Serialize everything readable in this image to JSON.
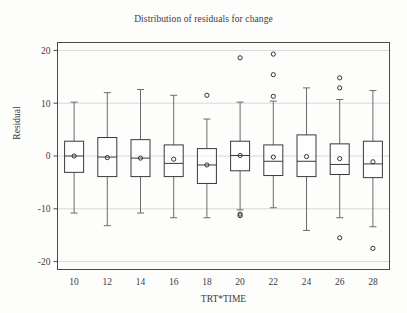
{
  "chart_data": {
    "type": "box",
    "title": "Distribution of residuals for change",
    "xlabel": "TRT*TIME",
    "ylabel": "Residual",
    "categories": [
      "10",
      "12",
      "14",
      "16",
      "18",
      "20",
      "22",
      "24",
      "26",
      "28"
    ],
    "ylim": [
      -21.5,
      21.5
    ],
    "yticks": [
      20,
      10,
      0,
      -10,
      -20
    ],
    "ytick_labels": [
      "20",
      "10",
      "0",
      "-10",
      "-20"
    ],
    "grid": "horizontal",
    "legend": "none",
    "marker_mean": "circle-open",
    "boxes": [
      {
        "category": "10",
        "whisker_low": -10.8,
        "q1": -3.1,
        "median": 0.0,
        "q3": 2.8,
        "whisker_high": 10.2,
        "mean": 0.0,
        "outliers": []
      },
      {
        "category": "12",
        "whisker_low": -13.2,
        "q1": -3.9,
        "median": -0.2,
        "q3": 3.5,
        "whisker_high": 12.0,
        "mean": -0.3,
        "outliers": []
      },
      {
        "category": "14",
        "whisker_low": -10.8,
        "q1": -3.9,
        "median": -0.4,
        "q3": 3.1,
        "whisker_high": 12.6,
        "mean": -0.4,
        "outliers": []
      },
      {
        "category": "16",
        "whisker_low": -11.7,
        "q1": -3.9,
        "median": -1.4,
        "q3": 2.1,
        "whisker_high": 11.5,
        "mean": -0.6,
        "outliers": []
      },
      {
        "category": "18",
        "whisker_low": -11.7,
        "q1": -5.2,
        "median": -1.7,
        "q3": 1.4,
        "whisker_high": 7.0,
        "mean": -1.7,
        "outliers": [
          11.5
        ]
      },
      {
        "category": "20",
        "whisker_low": -10.2,
        "q1": -2.8,
        "median": 0.1,
        "q3": 2.8,
        "whisker_high": 10.2,
        "mean": 0.1,
        "outliers": [
          18.6,
          -11.0,
          -11.3
        ]
      },
      {
        "category": "22",
        "whisker_low": -9.8,
        "q1": -3.7,
        "median": -1.0,
        "q3": 2.1,
        "whisker_high": 10.4,
        "mean": -0.2,
        "outliers": [
          19.3,
          15.4,
          11.3
        ]
      },
      {
        "category": "24",
        "whisker_low": -14.1,
        "q1": -3.9,
        "median": -1.0,
        "q3": 4.0,
        "whisker_high": 12.9,
        "mean": -0.1,
        "outliers": []
      },
      {
        "category": "26",
        "whisker_low": -11.7,
        "q1": -3.5,
        "median": -1.6,
        "q3": 2.3,
        "whisker_high": 10.7,
        "mean": -0.5,
        "outliers": [
          14.8,
          12.9,
          -15.5
        ]
      },
      {
        "category": "28",
        "whisker_low": -13.4,
        "q1": -4.1,
        "median": -1.5,
        "q3": 2.8,
        "whisker_high": 12.4,
        "mean": -1.1,
        "outliers": [
          -17.5
        ]
      }
    ],
    "colors": {
      "background": "#fdfdfc",
      "frame": "#4a4a4a",
      "box_line": "#3a3a3a",
      "whisker": "#6b6b6b",
      "gridline": "#d8d8d8",
      "text": "#3c3c3c"
    }
  }
}
